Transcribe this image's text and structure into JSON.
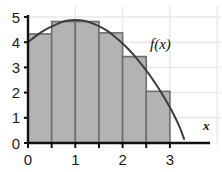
{
  "figure": {
    "title": "",
    "background_color": "#ffffff"
  },
  "labels": {
    "curve_label": "f(x)",
    "x_axis_label": "x",
    "y_axis_label": ""
  },
  "colors": {
    "rect_fill": "#b3b3b3",
    "rect_stroke": "#6e6e6e",
    "curve_stroke": "#3d3d3d",
    "axis": "#111111",
    "grid": "#e8e8e8",
    "text": "#1a1a1a"
  },
  "chart_data": {
    "type": "area",
    "title": "",
    "subtitle": "",
    "xlabel": "x",
    "ylabel": "",
    "xlim": [
      -0.12,
      3.55
    ],
    "ylim": [
      0,
      5.25
    ],
    "grid": true,
    "legend": "none",
    "annotations": [
      "f(x)"
    ],
    "x_ticks": [
      0,
      1,
      2,
      3
    ],
    "x_tick_labels": [
      "0",
      "1",
      "2",
      "3"
    ],
    "x_minor_ticks": [
      0.5,
      1.5,
      2.5
    ],
    "y_ticks": [
      0,
      1,
      2,
      3,
      4,
      5
    ],
    "y_tick_labels": [
      "0",
      "1",
      "2",
      "3",
      "4",
      "5"
    ],
    "series": [
      {
        "name": "f(x)",
        "type": "line",
        "x": [
          0,
          0.15,
          0.3,
          0.45,
          0.6,
          0.75,
          0.9,
          1.0,
          1.1,
          1.25,
          1.4,
          1.55,
          1.7,
          1.85,
          2.0,
          2.15,
          2.3,
          2.45,
          2.6,
          2.75,
          2.9,
          3.05,
          3.2,
          3.3
        ],
        "values": [
          4.0,
          4.22,
          4.42,
          4.58,
          4.71,
          4.82,
          4.87,
          4.88,
          4.87,
          4.82,
          4.72,
          4.59,
          4.42,
          4.2,
          3.95,
          3.67,
          3.35,
          3.0,
          2.62,
          2.2,
          1.74,
          1.24,
          0.66,
          0.16
        ]
      },
      {
        "name": "midpoint rectangles",
        "type": "bar",
        "bar_width": 0.5,
        "rule": "midpoint",
        "intervals": [
          [
            0,
            0.5
          ],
          [
            0.5,
            1.0
          ],
          [
            1.0,
            1.5
          ],
          [
            1.5,
            2.0
          ],
          [
            2.0,
            2.5
          ],
          [
            2.5,
            3.0
          ]
        ],
        "midpoints": [
          0.25,
          0.75,
          1.25,
          1.75,
          2.25,
          2.75
        ],
        "values": [
          4.33,
          4.82,
          4.82,
          4.37,
          3.43,
          2.05
        ]
      }
    ]
  }
}
